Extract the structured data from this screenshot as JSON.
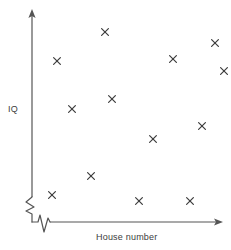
{
  "chart_data": {
    "type": "scatter",
    "title": "",
    "subtitle": "",
    "xlabel": "House number",
    "ylabel": "IQ",
    "legend": [],
    "grid": false,
    "axis_ticks": {
      "x": [],
      "y": []
    },
    "axis_style": {
      "arrow_heads": true,
      "x_axis_break": true,
      "y_axis_break": true,
      "line_color": "#555555",
      "marker_color": "#3c3c3c",
      "marker_symbol": "x",
      "background": "#ffffff"
    },
    "xlim": [
      0,
      231
    ],
    "ylim": [
      0,
      250
    ],
    "note": "Unlabeled axes; point values read off as pixel positions showing no relationship between the two variables.",
    "points": [
      {
        "x": 105,
        "y": 32
      },
      {
        "x": 215,
        "y": 43
      },
      {
        "x": 173,
        "y": 59
      },
      {
        "x": 57,
        "y": 61
      },
      {
        "x": 112,
        "y": 99
      },
      {
        "x": 72,
        "y": 109
      },
      {
        "x": 202,
        "y": 126
      },
      {
        "x": 153,
        "y": 139
      },
      {
        "x": 91,
        "y": 176
      },
      {
        "x": 52,
        "y": 195
      },
      {
        "x": 139,
        "y": 201
      },
      {
        "x": 190,
        "y": 201
      },
      {
        "x": 224,
        "y": 71
      }
    ],
    "point_count": 13
  },
  "axes": {
    "y": {
      "label": "IQ",
      "x_pixel": 32,
      "top_pixel": 11,
      "bottom_pixel": 222
    },
    "x": {
      "label": "House number",
      "y_pixel": 222,
      "left_pixel": 32,
      "right_pixel": 222
    }
  }
}
